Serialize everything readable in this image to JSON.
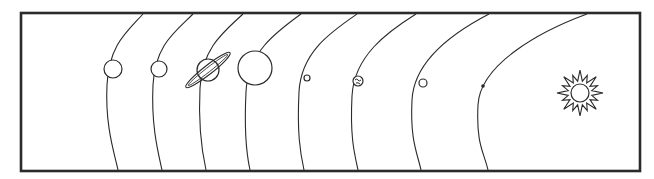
{
  "diagram": {
    "title": "Solar system orbits diagram",
    "colors": {
      "line": "#2a2a2a",
      "frame": "#2b2b2b",
      "background": "#ffffff"
    },
    "sun": {
      "name": "Sun",
      "cx": 580,
      "cy": 93,
      "r": 9,
      "rays": 16
    },
    "orbits": [
      {
        "name": "Neptune",
        "top": [
          143,
          14
        ],
        "mid": [
          107,
          85
        ],
        "bottom": [
          118,
          170
        ],
        "planet": {
          "cx": 113,
          "cy": 69,
          "r": 9,
          "style": "plain"
        }
      },
      {
        "name": "Uranus",
        "top": [
          193,
          14
        ],
        "mid": [
          153,
          85
        ],
        "bottom": [
          162,
          170
        ],
        "planet": {
          "cx": 159,
          "cy": 69,
          "r": 8,
          "style": "plain"
        }
      },
      {
        "name": "Saturn",
        "top": [
          243,
          14
        ],
        "mid": [
          200,
          88
        ],
        "bottom": [
          206,
          170
        ],
        "planet": {
          "cx": 208,
          "cy": 70,
          "r": 11,
          "style": "ringed"
        }
      },
      {
        "name": "Jupiter",
        "top": [
          301,
          14
        ],
        "mid": [
          246,
          92
        ],
        "bottom": [
          250,
          170
        ],
        "planet": {
          "cx": 255,
          "cy": 68,
          "r": 17,
          "style": "plain"
        }
      },
      {
        "name": "Mars",
        "top": [
          357,
          14
        ],
        "mid": [
          299,
          92
        ],
        "bottom": [
          304,
          170
        ],
        "planet": {
          "cx": 307,
          "cy": 78,
          "r": 3,
          "style": "plain"
        }
      },
      {
        "name": "Earth",
        "top": [
          416,
          14
        ],
        "mid": [
          352,
          96
        ],
        "bottom": [
          358,
          170
        ],
        "planet": {
          "cx": 358,
          "cy": 81,
          "r": 5,
          "style": "earth"
        }
      },
      {
        "name": "Venus",
        "top": [
          489,
          14
        ],
        "mid": [
          412,
          100
        ],
        "bottom": [
          421,
          170
        ],
        "planet": {
          "cx": 423,
          "cy": 83,
          "r": 4,
          "style": "plain"
        }
      },
      {
        "name": "Mercury",
        "top": [
          587,
          14
        ],
        "mid": [
          478,
          105
        ],
        "bottom": [
          488,
          170
        ],
        "planet": {
          "cx": 483,
          "cy": 86,
          "r": 1.8,
          "style": "dot"
        }
      }
    ],
    "frame": {
      "x": 21,
      "y": 13,
      "width": 619,
      "height": 158
    }
  }
}
